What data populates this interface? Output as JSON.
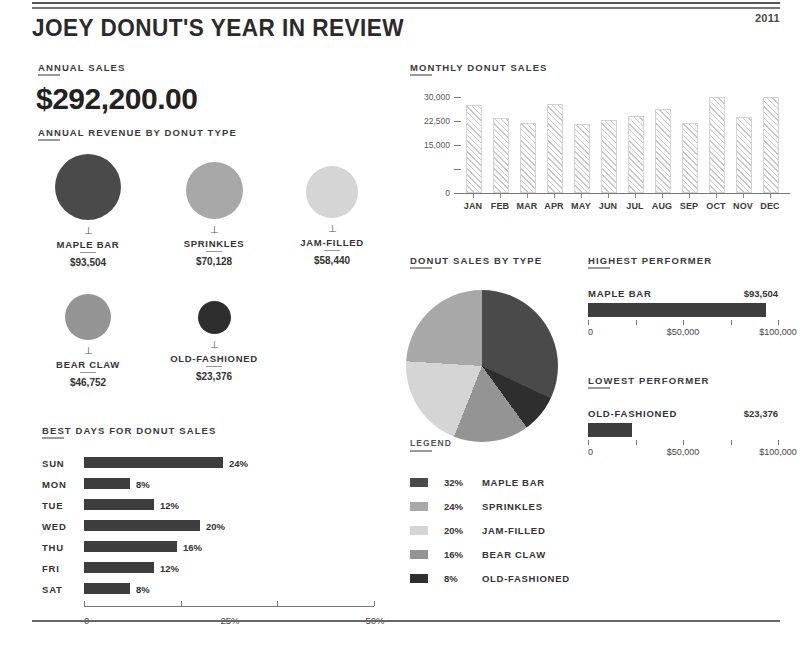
{
  "header": {
    "title": "JOEY DONUT'S YEAR IN REVIEW",
    "year": "2011"
  },
  "annual_sales": {
    "heading": "ANNUAL SALES",
    "value": "$292,200.00"
  },
  "revenue_by_type": {
    "heading": "ANNUAL REVENUE BY DONUT TYPE",
    "items": [
      {
        "name": "MAPLE BAR",
        "value": "$93,504",
        "amount": 93504,
        "color": "#4a4a4a",
        "diameter": 66,
        "cx": 88,
        "cy": 187
      },
      {
        "name": "SPRINKLES",
        "value": "$70,128",
        "amount": 70128,
        "color": "#a8a8a8",
        "diameter": 57,
        "cx": 214,
        "cy": 190
      },
      {
        "name": "JAM-FILLED",
        "value": "$58,440",
        "amount": 58440,
        "color": "#d5d5d5",
        "diameter": 52,
        "cx": 332,
        "cy": 192
      },
      {
        "name": "BEAR CLAW",
        "value": "$46,752",
        "amount": 46752,
        "color": "#949494",
        "diameter": 46,
        "cx": 88,
        "cy": 317
      },
      {
        "name": "OLD-FASHIONED",
        "value": "$23,376",
        "amount": 23376,
        "color": "#2e2e2e",
        "diameter": 33,
        "cx": 214,
        "cy": 317
      }
    ]
  },
  "best_days": {
    "heading": "BEST DAYS FOR DONUT SALES",
    "axis_labels": [
      "0",
      "25%",
      "50%"
    ],
    "axis_max": 50,
    "rows": [
      {
        "day": "SUN",
        "pct": 24,
        "label": "24%"
      },
      {
        "day": "MON",
        "pct": 8,
        "label": "8%"
      },
      {
        "day": "TUE",
        "pct": 12,
        "label": "12%"
      },
      {
        "day": "WED",
        "pct": 20,
        "label": "20%"
      },
      {
        "day": "THU",
        "pct": 16,
        "label": "16%"
      },
      {
        "day": "FRI",
        "pct": 12,
        "label": "12%"
      },
      {
        "day": "SAT",
        "pct": 8,
        "label": "8%"
      }
    ]
  },
  "donut_sales_by_type": {
    "heading": "DONUT SALES BY TYPE",
    "legend_heading": "LEGEND",
    "legend": [
      {
        "pct": "32%",
        "name": "MAPLE BAR",
        "color": "#4a4a4a"
      },
      {
        "pct": "24%",
        "name": "SPRINKLES",
        "color": "#a8a8a8"
      },
      {
        "pct": "20%",
        "name": "JAM-FILLED",
        "color": "#d5d5d5"
      },
      {
        "pct": "16%",
        "name": "BEAR CLAW",
        "color": "#949494"
      },
      {
        "pct": "8%",
        "name": "OLD-FASHIONED",
        "color": "#2e2e2e"
      }
    ]
  },
  "highest_performer": {
    "heading": "HIGHEST PERFORMER",
    "name": "MAPLE BAR",
    "value": "$93,504",
    "amount": 93504,
    "axis_max": 100000,
    "axis_labels": [
      "0",
      "$50,000",
      "$100,000"
    ]
  },
  "lowest_performer": {
    "heading": "LOWEST PERFORMER",
    "name": "OLD-FASHIONED",
    "value": "$23,376",
    "amount": 23376,
    "axis_max": 100000,
    "axis_labels": [
      "0",
      "$50,000",
      "$100,000"
    ]
  },
  "chart_data": [
    {
      "type": "bar",
      "title": "MONTHLY DONUT SALES",
      "xlabel": "",
      "ylabel": "",
      "categories": [
        "JAN",
        "FEB",
        "MAR",
        "APR",
        "MAY",
        "JUN",
        "JUL",
        "AUG",
        "SEP",
        "OCT",
        "NOV",
        "DEC"
      ],
      "values": [
        26900,
        22800,
        21400,
        27200,
        20900,
        22300,
        23400,
        25600,
        21100,
        29400,
        23200,
        29400
      ],
      "ylim": [
        0,
        32000
      ],
      "yticks": [
        0,
        7500,
        15000,
        22500,
        30000
      ],
      "ytick_labels": [
        "0",
        "",
        "15,000",
        "22,500",
        "30,000"
      ],
      "grid": false,
      "legend": "none"
    },
    {
      "type": "bar",
      "title": "BEST DAYS FOR DONUT SALES",
      "orientation": "horizontal",
      "categories": [
        "SUN",
        "MON",
        "TUE",
        "WED",
        "THU",
        "FRI",
        "SAT"
      ],
      "values": [
        24,
        8,
        12,
        20,
        16,
        12,
        8
      ],
      "xlabel": "",
      "ylabel": "",
      "xlim": [
        0,
        50
      ],
      "xticks": [
        0,
        25,
        50
      ],
      "xtick_labels": [
        "0",
        "25%",
        "50%"
      ],
      "grid": false
    },
    {
      "type": "pie",
      "title": "DONUT SALES BY TYPE",
      "labels": [
        "MAPLE BAR",
        "OLD-FASHIONED",
        "BEAR CLAW",
        "JAM-FILLED",
        "SPRINKLES"
      ],
      "values": [
        32,
        8,
        16,
        20,
        24
      ],
      "colors": [
        "#4a4a4a",
        "#2e2e2e",
        "#949494",
        "#d5d5d5",
        "#a8a8a8"
      ],
      "start_angle": 0,
      "direction": "clockwise",
      "legend": "below"
    },
    {
      "type": "bar",
      "title": "ANNUAL REVENUE BY DONUT TYPE",
      "subtype": "bubble",
      "categories": [
        "MAPLE BAR",
        "SPRINKLES",
        "JAM-FILLED",
        "BEAR CLAW",
        "OLD-FASHIONED"
      ],
      "values": [
        93504,
        70128,
        58440,
        46752,
        23376
      ],
      "value_labels": [
        "$93,504",
        "$70,128",
        "$58,440",
        "$46,752",
        "$23,376"
      ]
    }
  ]
}
